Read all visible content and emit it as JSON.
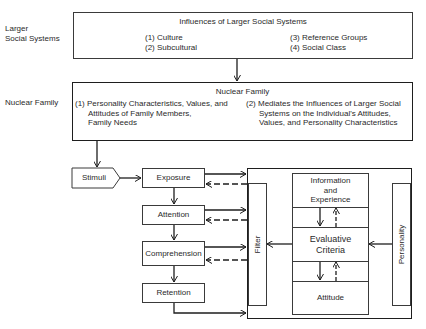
{
  "side_labels": {
    "larger_social_systems": [
      "Larger",
      "Social Systems"
    ],
    "nuclear_family": "Nuclear Family"
  },
  "larger_social_box": {
    "title": "Influences of Larger Social Systems",
    "items": [
      "(1) Culture",
      "(2) Subcultural",
      "(3) Reference Groups",
      "(4) Social Class"
    ]
  },
  "nuclear_family_box": {
    "title": "Nuclear Family",
    "item1": [
      "(1) Personality Characteristics, Values, and",
      "Attitudes of Family Members,",
      "Family Needs"
    ],
    "item2": [
      "(2) Mediates the Influences of Larger Social",
      "Systems on the Individual's Attitudes,",
      "Values, and Personality Characteristics"
    ]
  },
  "stimuli": "Stimuli",
  "process_steps": [
    "Exposure",
    "Attention",
    "Comprehension",
    "Retention"
  ],
  "filter": "Filter",
  "personality": "Personality",
  "core": {
    "information": [
      "Information",
      "and",
      "Experience"
    ],
    "evaluative": [
      "Evaluative",
      "Criteria"
    ],
    "attitude": "Attitude"
  },
  "colors": {
    "line": "#1e1e1e",
    "thin_line": "#3a3a3a",
    "background": "#ffffff"
  }
}
